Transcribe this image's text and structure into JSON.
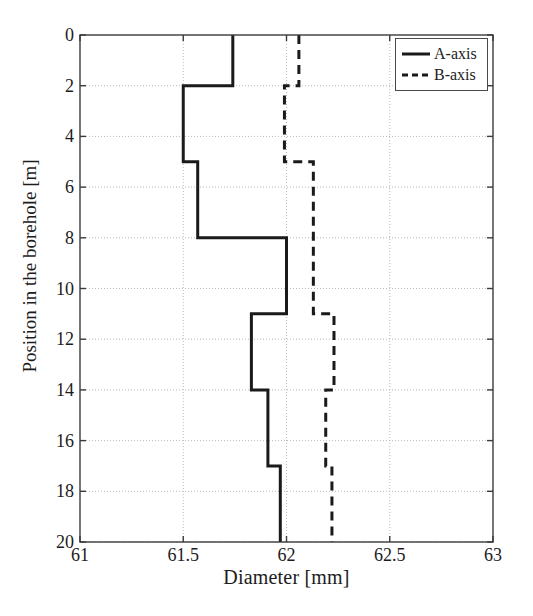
{
  "chart_data": {
    "type": "line",
    "title": "",
    "subtitle": "",
    "xlabel": "Diameter [mm]",
    "ylabel": "Position in the borehole [m]",
    "xlim": [
      61,
      63
    ],
    "ylim": [
      0,
      20
    ],
    "y_inverted": true,
    "grid": true,
    "grid_style": "dotted",
    "xticks": [
      61,
      61.5,
      62,
      62.5,
      63
    ],
    "xtick_labels": [
      "61",
      "61.5",
      "62",
      "62.5",
      "63"
    ],
    "yticks": [
      0,
      2,
      4,
      6,
      8,
      10,
      12,
      14,
      16,
      18,
      20
    ],
    "ytick_labels": [
      "0",
      "2",
      "4",
      "6",
      "8",
      "10",
      "12",
      "14",
      "16",
      "18",
      "20"
    ],
    "legend_position": "top-right",
    "orientation": "horizontal-value-vertical-depth",
    "series": [
      {
        "name": "A-axis",
        "style": "solid",
        "color": "#1a1a1a",
        "width": 3,
        "segments": [
          {
            "depth_from": 0,
            "depth_to": 2,
            "diameter": 61.74
          },
          {
            "depth_from": 2,
            "depth_to": 5,
            "diameter": 61.5
          },
          {
            "depth_from": 5,
            "depth_to": 8,
            "diameter": 61.57
          },
          {
            "depth_from": 8,
            "depth_to": 11,
            "diameter": 62.0
          },
          {
            "depth_from": 11,
            "depth_to": 14,
            "diameter": 61.83
          },
          {
            "depth_from": 14,
            "depth_to": 17,
            "diameter": 61.91
          },
          {
            "depth_from": 17,
            "depth_to": 20,
            "diameter": 61.97
          }
        ]
      },
      {
        "name": "B-axis",
        "style": "dashed",
        "color": "#1a1a1a",
        "width": 3,
        "segments": [
          {
            "depth_from": 0,
            "depth_to": 2,
            "diameter": 62.06
          },
          {
            "depth_from": 2,
            "depth_to": 5,
            "diameter": 61.99
          },
          {
            "depth_from": 5,
            "depth_to": 11,
            "diameter": 62.13
          },
          {
            "depth_from": 11,
            "depth_to": 14,
            "diameter": 62.23
          },
          {
            "depth_from": 14,
            "depth_to": 17,
            "diameter": 62.19
          },
          {
            "depth_from": 17,
            "depth_to": 20,
            "diameter": 62.22
          }
        ]
      }
    ]
  },
  "legend": {
    "items": [
      {
        "label": "A-axis",
        "style": "solid"
      },
      {
        "label": "B-axis",
        "style": "dashed"
      }
    ]
  },
  "plot_box": {
    "left": 80,
    "right": 493,
    "top": 35,
    "bottom": 542
  }
}
